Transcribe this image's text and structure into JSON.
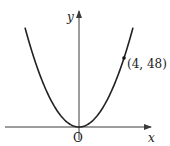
{
  "diagram": {
    "type": "function-graph",
    "axes": {
      "x_label": "x",
      "y_label": "y",
      "origin_label": "O"
    },
    "curve": {
      "kind": "parabola",
      "equation_implied": "y = 3x^2",
      "vertex": [
        0,
        0
      ]
    },
    "marked_point": {
      "coords": [
        4,
        48
      ],
      "label": "(4, 48)"
    },
    "colors": {
      "curve": "#222222",
      "axes": "#3a3a3a",
      "text": "#222222",
      "background": "#ffffff"
    }
  }
}
